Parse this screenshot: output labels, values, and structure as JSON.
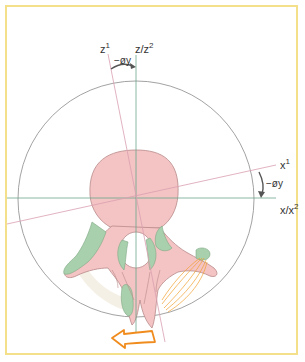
{
  "diagram": {
    "type": "vertebra-axial-rotation",
    "labels": {
      "z1_base": "z",
      "z1_sup": "1",
      "z_z2_base": "z/z",
      "z_z2_sup": "2",
      "angle_top": "−øy",
      "x1_base": "x",
      "x1_sup": "1",
      "angle_right": "−øy",
      "x_x2_base": "x/x",
      "x_x2_sup": "2"
    },
    "colors": {
      "frame": "#f4e08a",
      "circle": "#8a8a8a",
      "fixed_axes": "#6aa68a",
      "rotated_axes": "#d9a0b0",
      "bone_body": "#f4c3c3",
      "bone_outline": "#b88a8a",
      "cartilage": "#a8d0ac",
      "ligament": "#f0a030",
      "rotation_arrow": "#f08c1e",
      "angle_arrow": "#555555"
    }
  }
}
